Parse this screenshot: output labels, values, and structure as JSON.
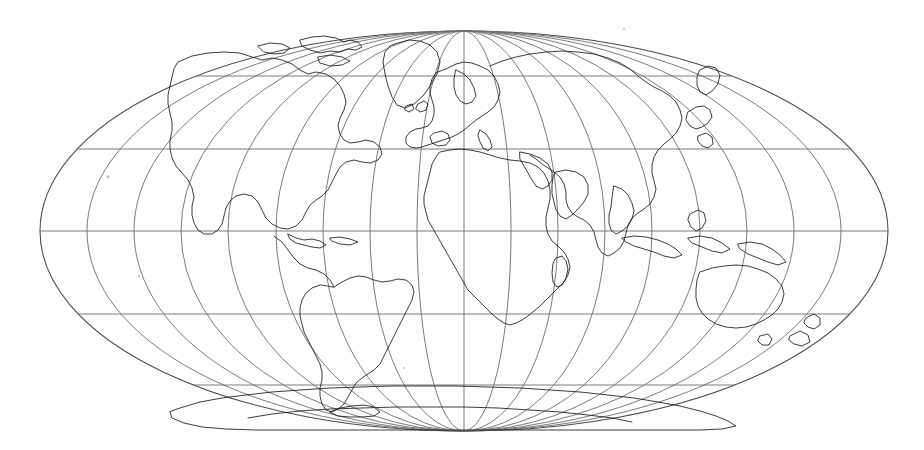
{
  "figure": {
    "kind": "world-map",
    "title": "World map outline, Mollweide (elliptical pseudocylindrical) projection",
    "style": {
      "background_color": "#ffffff",
      "coastline_color": "#1a1a1a",
      "graticule_color": "#6d6d6d",
      "outline_color": "#4a4a4a"
    }
  },
  "projection": {
    "name": "Mollweide",
    "center_x": 464,
    "center_y": 231,
    "half_width": 424,
    "half_height": 200,
    "central_meridian": 0
  },
  "graticule": {
    "meridian_interval_degrees": 20,
    "parallel_interval_degrees": 30,
    "meridians": [
      -180,
      -160,
      -140,
      -120,
      -100,
      -80,
      -60,
      -40,
      -20,
      0,
      20,
      40,
      60,
      80,
      100,
      120,
      140,
      160,
      180
    ],
    "parallels": [
      60,
      30,
      0,
      -30,
      -60
    ],
    "equator_label": "0",
    "grid_visible": true
  },
  "regions": [
    {
      "name": "north-america",
      "label": "North America"
    },
    {
      "name": "south-america",
      "label": "South America"
    },
    {
      "name": "greenland",
      "label": "Greenland"
    },
    {
      "name": "europe",
      "label": "Europe"
    },
    {
      "name": "africa",
      "label": "Africa"
    },
    {
      "name": "asia",
      "label": "Asia"
    },
    {
      "name": "australia",
      "label": "Australia"
    },
    {
      "name": "antarctica",
      "label": "Antarctica"
    },
    {
      "name": "new-zealand",
      "label": "New Zealand"
    },
    {
      "name": "japan",
      "label": "Japan"
    },
    {
      "name": "madagascar",
      "label": "Madagascar"
    },
    {
      "name": "british-isles",
      "label": "British Isles"
    },
    {
      "name": "indonesia",
      "label": "Indonesia"
    },
    {
      "name": "arctic-islands",
      "label": "Canadian Arctic Archipelago"
    }
  ],
  "map_data": {
    "type": "outline-map",
    "coastline_count": 14,
    "land_fill": "none",
    "ocean_fill": "none"
  }
}
